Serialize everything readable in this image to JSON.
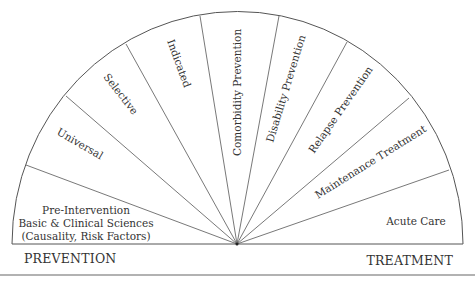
{
  "diagram": {
    "type": "semicircle-spectrum",
    "segments": [
      {
        "id": "pre-intervention",
        "label": "Pre-Intervention",
        "sublines": [
          "Basic & Clinical Sciences",
          "(Causality, Risk Factors)"
        ]
      },
      {
        "id": "universal",
        "label": "Universal"
      },
      {
        "id": "selective",
        "label": "Selective"
      },
      {
        "id": "indicated",
        "label": "Indicated"
      },
      {
        "id": "comorbidity-prevention",
        "label": "Comorbidity Prevention"
      },
      {
        "id": "disability-prevention",
        "label": "Disability Prevention"
      },
      {
        "id": "relapse-prevention",
        "label": "Relapse Prevention"
      },
      {
        "id": "maintenance-treatment",
        "label": "Maintenance Treatment"
      },
      {
        "id": "acute-care",
        "label": "Acute Care"
      }
    ],
    "footer": {
      "left": "PREVENTION",
      "right": "TREATMENT"
    },
    "colors": {
      "stroke": "#555555",
      "text": "#333333",
      "background": "#ffffff"
    }
  }
}
